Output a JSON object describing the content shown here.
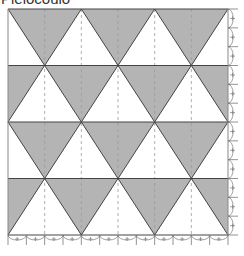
{
  "title": "Pleiocoulo",
  "grid": {
    "left": 8,
    "top": 9,
    "width": 220,
    "height": 226,
    "rows": 4,
    "triangles_per_row": 3
  },
  "colors": {
    "fill": "#b4b4b4",
    "background": "#ffffff",
    "line": "#444444",
    "dashed": "#9a9a9a",
    "ticks": "#777777"
  },
  "row_patterns": [
    "down",
    "up",
    "down",
    "up"
  ],
  "ticks": {
    "bottom_count": 12,
    "right_count": 12
  }
}
